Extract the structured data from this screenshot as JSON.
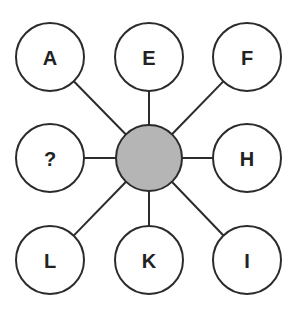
{
  "diagram": {
    "type": "hub-and-spoke puzzle",
    "colors": {
      "stroke": "#2b2b2b",
      "hub_fill": "#b5b5b5",
      "node_fill": "#ffffff",
      "text": "#222222"
    },
    "hub": {
      "label": "",
      "cx": 149,
      "cy": 158,
      "r": 33
    },
    "nodes": [
      {
        "id": "top-left",
        "label": "A",
        "cx": 50,
        "cy": 57
      },
      {
        "id": "top-center",
        "label": "E",
        "cx": 149,
        "cy": 57
      },
      {
        "id": "top-right",
        "label": "F",
        "cx": 247,
        "cy": 57
      },
      {
        "id": "middle-left",
        "label": "?",
        "cx": 50,
        "cy": 158
      },
      {
        "id": "middle-right",
        "label": "H",
        "cx": 247,
        "cy": 158
      },
      {
        "id": "bottom-left",
        "label": "L",
        "cx": 50,
        "cy": 260
      },
      {
        "id": "bottom-center",
        "label": "K",
        "cx": 149,
        "cy": 260
      },
      {
        "id": "bottom-right",
        "label": "I",
        "cx": 247,
        "cy": 260
      }
    ],
    "node_radius": 34
  }
}
